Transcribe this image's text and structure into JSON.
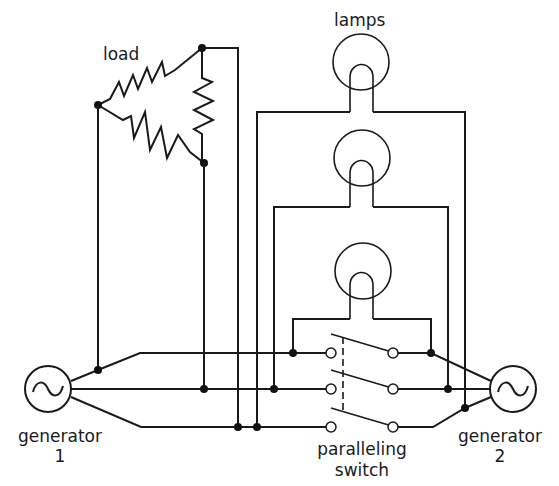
{
  "diagram": {
    "type": "circuit-schematic",
    "labels": {
      "load": "load",
      "lamps": "lamps",
      "generator1_line1": "generator",
      "generator1_line2": "1",
      "generator2_line1": "generator",
      "generator2_line2": "2",
      "switch_line1": "paralleling",
      "switch_line2": "switch"
    },
    "components": [
      {
        "id": "load",
        "kind": "delta-connected resistors",
        "count": 3
      },
      {
        "id": "lamps",
        "kind": "incandescent lamps",
        "count": 3
      },
      {
        "id": "generator-1",
        "kind": "AC generator",
        "symbol": "~"
      },
      {
        "id": "generator-2",
        "kind": "AC generator",
        "symbol": "~"
      },
      {
        "id": "paralleling-switch",
        "kind": "three-pole switch (ganged)",
        "poles": 3
      }
    ],
    "colors": {
      "line": "#1a1a1a",
      "background": "#ffffff"
    }
  }
}
